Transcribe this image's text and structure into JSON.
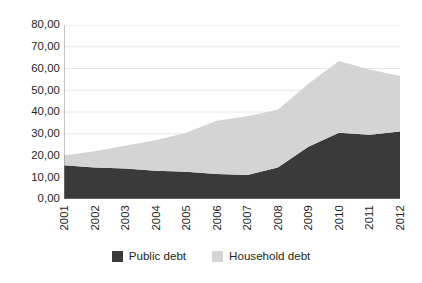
{
  "chart_data": {
    "type": "area",
    "stacked": true,
    "title": "",
    "subtitle": "",
    "xlabel": "",
    "ylabel": "",
    "categories": [
      "2001",
      "2002",
      "2003",
      "2004",
      "2005",
      "2006",
      "2007",
      "2008",
      "2009",
      "2010",
      "2011",
      "2012"
    ],
    "series": [
      {
        "name": "Public debt",
        "color": "#3a3a3a",
        "values": [
          15.5,
          14.5,
          14.0,
          13.0,
          12.5,
          11.5,
          11.0,
          14.5,
          24.0,
          30.5,
          29.5,
          31.0
        ]
      },
      {
        "name": "Household debt",
        "color": "#d4d4d4",
        "values": [
          4.5,
          7.5,
          10.5,
          14.0,
          18.0,
          24.5,
          27.0,
          26.5,
          29.0,
          33.0,
          30.0,
          25.5
        ]
      }
    ],
    "stacked_totals": [
      20.0,
      22.0,
      24.5,
      27.0,
      30.5,
      36.0,
      38.0,
      41.0,
      53.0,
      63.5,
      59.5,
      56.5
    ],
    "ylim": [
      0,
      80
    ],
    "ytick_step": 10,
    "ytick_labels": [
      "80,00",
      "70,00",
      "60,00",
      "50,00",
      "40,00",
      "30,00",
      "20,00",
      "10,00",
      "0,00"
    ],
    "ytick_values": [
      80,
      70,
      60,
      50,
      40,
      30,
      20,
      10,
      0
    ],
    "grid": true,
    "grid_axis": "y",
    "grid_color": "#e8e8e8",
    "legend_position": "bottom",
    "xtick_rotation": -90,
    "decimal_separator": ","
  },
  "legend": {
    "items": [
      {
        "label": "Public debt",
        "color": "#3a3a3a",
        "swatch_name": "legend-swatch-public-debt"
      },
      {
        "label": "Household debt",
        "color": "#d4d4d4",
        "swatch_name": "legend-swatch-household-debt"
      }
    ]
  },
  "axis": {
    "baseline_color": "#8c8c8c",
    "left_spine_color": "#8c8c8c"
  }
}
